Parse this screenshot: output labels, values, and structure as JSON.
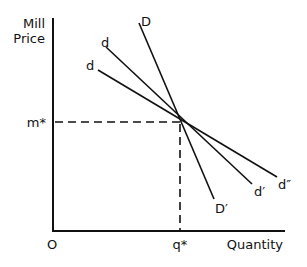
{
  "diagram": {
    "y_axis_label_line1": "Mill",
    "y_axis_label_line2": "Price",
    "x_axis_label": "Quantity",
    "origin_label": "O",
    "price_marker_label": "m*",
    "quantity_marker_label": "q*",
    "curves": [
      {
        "name": "D",
        "start_label": "D",
        "end_label": "D′"
      },
      {
        "name": "d-upper",
        "start_label": "d",
        "end_label": "d′"
      },
      {
        "name": "d-lower",
        "start_label": "d",
        "end_label": "d″"
      }
    ],
    "line_color": "#111111",
    "background": "#ffffff"
  }
}
